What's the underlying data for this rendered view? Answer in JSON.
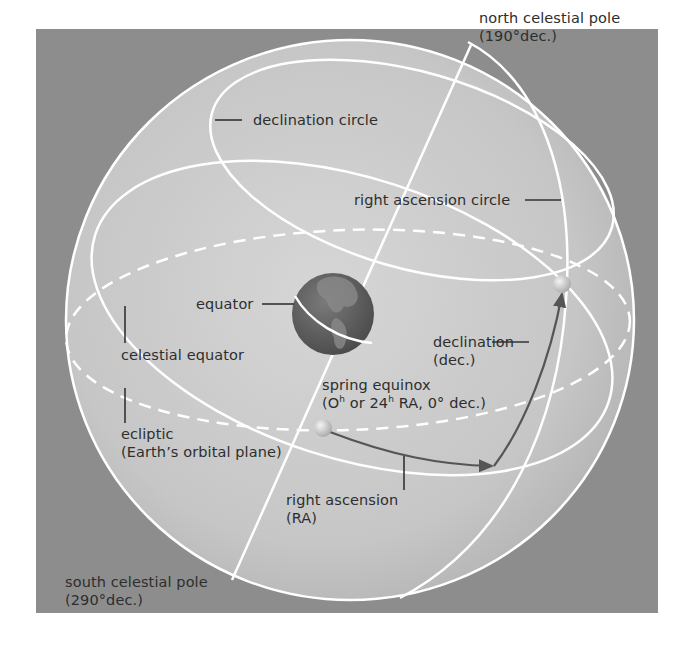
{
  "figure": {
    "type": "celestial sphere diagram",
    "colors": {
      "background_panel": "#8d8d8d",
      "sphere_fill": "#c9c9c9",
      "lines": "#ffffff",
      "arrows": "#555555",
      "text": "#2e2e2e",
      "earth": "#5e5e5e"
    }
  },
  "labels": {
    "north_pole": {
      "line1": "north celestial pole",
      "line2": "(190°dec.)"
    },
    "declination_circle": "declination circle",
    "right_ascension_circle": "right ascension circle",
    "equator": "equator",
    "celestial_equator": "celestial equator",
    "declination": {
      "line1": "declination",
      "line2": "(dec.)"
    },
    "spring_equinox": {
      "line1": "spring equinox",
      "line2_pre": "(O",
      "sup1": "h",
      "line2_mid": " or 24",
      "sup2": "h",
      "line2_post": " RA, 0° dec.)"
    },
    "ecliptic": {
      "line1": "ecliptic",
      "line2": "(Earth’s orbital plane)"
    },
    "right_ascension": {
      "line1": "right ascension",
      "line2": "(RA)"
    },
    "south_pole": {
      "line1": "south celestial pole",
      "line2": "(290°dec.)"
    }
  }
}
